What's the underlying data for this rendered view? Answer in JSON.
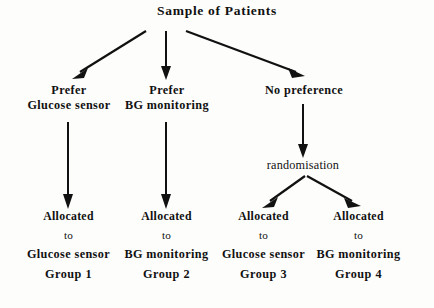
{
  "diagram": {
    "title": "Sample of Patients",
    "root": {
      "label": "Sample of Patients"
    },
    "branches": [
      {
        "id": "prefer-glucose",
        "line1": "Prefer",
        "line2": "Glucose sensor"
      },
      {
        "id": "prefer-bg",
        "line1": "Prefer",
        "line2": "BG monitoring"
      },
      {
        "id": "no-preference",
        "line1": "No preference",
        "line2": ""
      }
    ],
    "randomisation": {
      "label": "randomisation"
    },
    "outcomes": [
      {
        "id": "group-1",
        "allocated": "Allocated",
        "to": "to",
        "arm": "Glucose sensor",
        "group": "Group 1"
      },
      {
        "id": "group-2",
        "allocated": "Allocated",
        "to": "to",
        "arm": "BG monitoring",
        "group": "Group 2"
      },
      {
        "id": "group-3",
        "allocated": "Allocated",
        "to": "to",
        "arm": "Glucose sensor",
        "group": "Group 3"
      },
      {
        "id": "group-4",
        "allocated": "Allocated",
        "to": "to",
        "arm": "BG monitoring",
        "group": "Group 4"
      }
    ],
    "colors": {
      "ink": "#111111",
      "background": "#fdfdfc"
    }
  }
}
